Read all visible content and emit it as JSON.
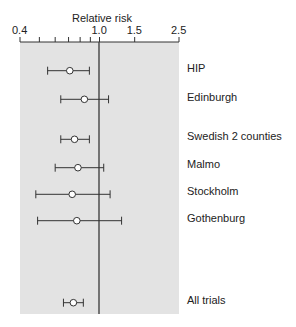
{
  "chart_data": {
    "type": "forest",
    "title": "",
    "xlabel": "Relative risk",
    "ylabel": "",
    "x_scale": "log",
    "xlim": [
      0.4,
      2.5
    ],
    "x_ticks_major": [
      {
        "value": 0.4,
        "label": "0.4"
      },
      {
        "value": 1.0,
        "label": "1.0"
      },
      {
        "value": 1.5,
        "label": "1.5"
      },
      {
        "value": 2.5,
        "label": "2.5"
      }
    ],
    "x_ticks_minor": [
      0.5,
      0.6,
      0.7,
      0.8,
      0.9
    ],
    "reference_line": 1.0,
    "grid": false,
    "legend": null,
    "categories": [
      "HIP",
      "Edinburgh",
      "Swedish 2 counties",
      "Malmo",
      "Stockholm",
      "Gothenburg",
      "All trials"
    ],
    "series": [
      {
        "name": "HIP",
        "estimate": 0.71,
        "ci_low": 0.55,
        "ci_high": 0.89
      },
      {
        "name": "Edinburgh",
        "estimate": 0.84,
        "ci_low": 0.64,
        "ci_high": 1.11
      },
      {
        "name": "Swedish 2 counties",
        "estimate": 0.75,
        "ci_low": 0.64,
        "ci_high": 0.89
      },
      {
        "name": "Malmo",
        "estimate": 0.78,
        "ci_low": 0.6,
        "ci_high": 1.05
      },
      {
        "name": "Stockholm",
        "estimate": 0.73,
        "ci_low": 0.48,
        "ci_high": 1.13
      },
      {
        "name": "Gothenburg",
        "estimate": 0.77,
        "ci_low": 0.49,
        "ci_high": 1.29
      },
      {
        "name": "All trials",
        "estimate": 0.74,
        "ci_low": 0.66,
        "ci_high": 0.83
      }
    ],
    "colors": {
      "panel": "#e3e3e3",
      "line": "#333333",
      "marker_fill": "#ffffff"
    }
  }
}
